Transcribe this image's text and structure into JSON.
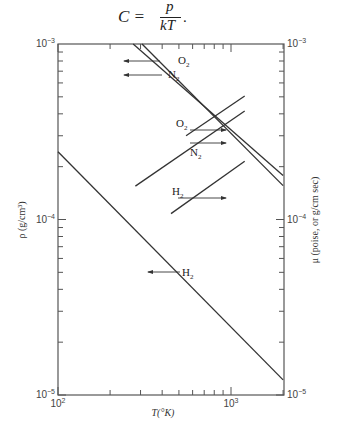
{
  "formula": {
    "lhs": "C =",
    "numerator": "p",
    "denominator": "kT",
    "trailing": "."
  },
  "chart_data": {
    "type": "line",
    "title": "",
    "xlabel": "T(°K)",
    "ylabel_left": "ρ (g/cm³)",
    "ylabel_right": "μ (poise, or g/cm sec)",
    "xscale": "log",
    "yscale": "log",
    "xlim": [
      100,
      2000
    ],
    "ylim": [
      1e-05,
      0.001
    ],
    "x_tick_labels": [
      {
        "base": "10",
        "exp": "2",
        "value": 100
      },
      {
        "base": "10",
        "exp": "3",
        "value": 1000
      }
    ],
    "y_tick_labels_left": [
      {
        "base": "10",
        "exp": "−3",
        "value": 0.001
      },
      {
        "base": "10",
        "exp": "−4",
        "value": 0.0001
      },
      {
        "base": "10",
        "exp": "−5",
        "value": 1e-05
      }
    ],
    "y_tick_labels_right": [
      {
        "base": "10",
        "exp": "−3",
        "value": 0.001
      },
      {
        "base": "10",
        "exp": "−4",
        "value": 0.0001
      },
      {
        "base": "10",
        "exp": "−5",
        "value": 1e-05
      }
    ],
    "grid": false,
    "legend": "inline labels with arrows pointing to relevant axis",
    "series": [
      {
        "name": "O2",
        "quantity": "density ρ",
        "axis": "left",
        "arrow": "left",
        "x": [
          272,
          2000
        ],
        "y": [
          0.001,
          0.000178
        ]
      },
      {
        "name": "N2",
        "quantity": "density ρ",
        "axis": "left",
        "arrow": "left",
        "x": [
          306,
          2000
        ],
        "y": [
          0.001,
          0.000156
        ]
      },
      {
        "name": "H2",
        "quantity": "density ρ",
        "axis": "left",
        "arrow": "left",
        "x": [
          100,
          2000
        ],
        "y": [
          0.000243,
          1.22e-05
        ]
      },
      {
        "name": "O2",
        "quantity": "viscosity μ",
        "axis": "right",
        "arrow": "right",
        "x": [
          550,
          1200
        ],
        "y": [
          0.0003,
          0.000506
        ]
      },
      {
        "name": "N2",
        "quantity": "viscosity μ",
        "axis": "right",
        "arrow": "right",
        "x": [
          280,
          1200
        ],
        "y": [
          0.000155,
          0.000415
        ]
      },
      {
        "name": "H2",
        "quantity": "viscosity μ",
        "axis": "right",
        "arrow": "right",
        "x": [
          450,
          1200
        ],
        "y": [
          0.000108,
          0.000215
        ]
      }
    ]
  }
}
